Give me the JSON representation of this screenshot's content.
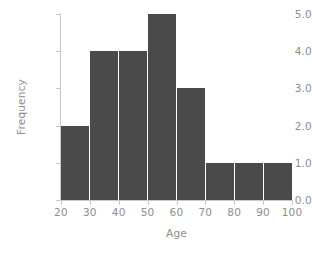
{
  "chart_data": {
    "type": "bar",
    "title": "",
    "subtitle": "",
    "xlabel": "Age",
    "ylabel": "Frequency",
    "categories": [
      "20-30",
      "30-40",
      "40-50",
      "50-60",
      "60-70",
      "70-80",
      "80-90",
      "90-100"
    ],
    "bin_edges": [
      20,
      30,
      40,
      50,
      60,
      70,
      80,
      90,
      100
    ],
    "values": [
      2,
      4,
      4,
      5,
      3,
      1,
      1,
      1
    ],
    "xlim": [
      20,
      100
    ],
    "ylim": [
      0,
      5
    ],
    "xticks": [
      "20",
      "30",
      "40",
      "50",
      "60",
      "70",
      "80",
      "90",
      "100"
    ],
    "yticks": [
      "0.0",
      "1.0",
      "2.0",
      "3.0",
      "4.0",
      "5.0"
    ],
    "grid": false,
    "legend": null,
    "bar_color": "#4a4a4a",
    "bar_edge_color": "#ffffff",
    "axis_color": "#c9c9c9",
    "tick_label_color": "#8d8d8d",
    "background_color": "#ffffff",
    "annotations": []
  }
}
